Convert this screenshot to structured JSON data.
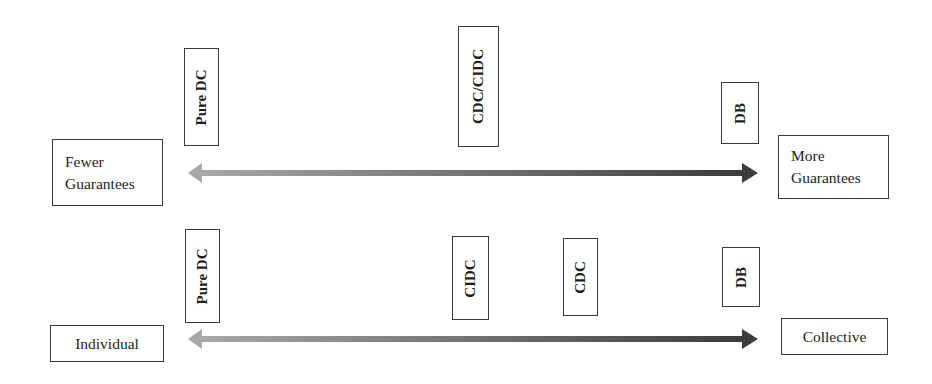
{
  "diagram": {
    "top_spectrum": {
      "left_label": [
        "Fewer",
        "Guarantees"
      ],
      "right_label": [
        "More",
        "Guarantees"
      ],
      "markers": [
        "Pure DC",
        "CDC/CIDC",
        "DB"
      ],
      "arrow": {
        "from_color": "#a8a8a8",
        "to_color": "#3c3c3c"
      }
    },
    "bottom_spectrum": {
      "left_label": "Individual",
      "right_label": "Collective",
      "markers": [
        "Pure DC",
        "CIDC",
        "CDC",
        "DB"
      ],
      "arrow": {
        "from_color": "#a8a8a8",
        "to_color": "#3c3c3c"
      }
    }
  }
}
